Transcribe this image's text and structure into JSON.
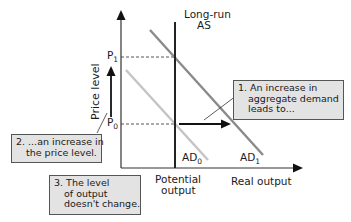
{
  "diagram": {
    "y_axis_label": "Price level",
    "x_axis_label": "Real output",
    "lras_label_line1": "Long-run",
    "lras_label_line2": "AS",
    "potential_output_line1": "Potential",
    "potential_output_line2": "output",
    "price_levels": [
      {
        "base": "P",
        "sub": "1"
      },
      {
        "base": "P",
        "sub": "0"
      }
    ],
    "curves": [
      {
        "base": "AD",
        "sub": "0",
        "color": "#c4c4c4"
      },
      {
        "base": "AD",
        "sub": "1",
        "color": "#8a8a8a"
      }
    ],
    "callouts": [
      {
        "lines": [
          "1. An increase in",
          "aggregate demand",
          "leads to..."
        ]
      },
      {
        "lines": [
          "2. ...an increase in",
          "the price level."
        ]
      },
      {
        "lines": [
          "3. The level",
          "of output",
          "doesn't change."
        ]
      }
    ],
    "colors": {
      "axis": "#333333",
      "lras": "#222222",
      "callout_bg": "#e3e3e3",
      "callout_border": "#555555"
    }
  }
}
